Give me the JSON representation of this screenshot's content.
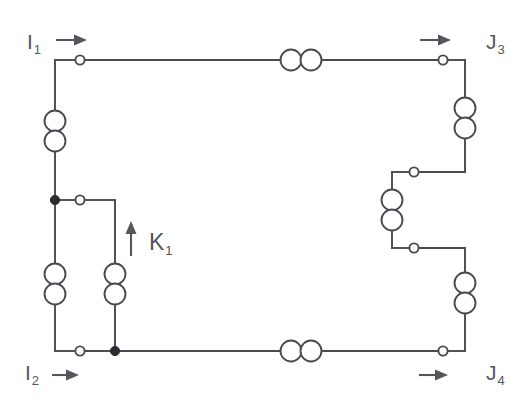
{
  "diagram": {
    "type": "electrical-circuit-schematic",
    "background_color": "#ffffff",
    "wire_color": "#4a4a52",
    "label_color": "#55555d",
    "junction_color": "#2b2b30"
  },
  "labels": {
    "input_top": {
      "symbol": "I",
      "subscript": "1",
      "text": "I1"
    },
    "input_bottom": {
      "symbol": "I",
      "subscript": "2",
      "text": "I2"
    },
    "output_top": {
      "symbol": "J",
      "subscript": "3",
      "text": "J3"
    },
    "output_bottom": {
      "symbol": "J",
      "subscript": "4",
      "text": "J4"
    },
    "branch_current": {
      "symbol": "K",
      "subscript": "1",
      "text": "K1"
    }
  },
  "arrows": [
    {
      "name": "current-arrow-i1",
      "direction": "right",
      "associated_label": "I1"
    },
    {
      "name": "current-arrow-i2",
      "direction": "right",
      "associated_label": "I2"
    },
    {
      "name": "current-arrow-j3",
      "direction": "right",
      "associated_label": "J3"
    },
    {
      "name": "current-arrow-j4",
      "direction": "right",
      "associated_label": "J4"
    },
    {
      "name": "current-arrow-k1",
      "direction": "up",
      "associated_label": "K1"
    }
  ],
  "components": {
    "coils": [
      {
        "name": "coil-top-rail",
        "orientation": "horizontal",
        "position": "top-rail-center"
      },
      {
        "name": "coil-bottom-rail",
        "orientation": "horizontal",
        "position": "bottom-rail-center"
      },
      {
        "name": "coil-left-upper",
        "orientation": "vertical",
        "position": "left-rail-upper"
      },
      {
        "name": "coil-left-lower",
        "orientation": "vertical",
        "position": "left-rail-lower"
      },
      {
        "name": "coil-middle-branch",
        "orientation": "vertical",
        "position": "middle-branch"
      },
      {
        "name": "coil-right-upper",
        "orientation": "vertical",
        "position": "right-rail-upper"
      },
      {
        "name": "coil-right-middle",
        "orientation": "vertical",
        "position": "right-staircase-middle"
      },
      {
        "name": "coil-right-lower",
        "orientation": "vertical",
        "position": "right-rail-lower"
      }
    ],
    "open_terminals": [
      {
        "name": "terminal-i1",
        "position": "top-left"
      },
      {
        "name": "terminal-j3",
        "position": "top-right"
      },
      {
        "name": "terminal-i2",
        "position": "bottom-left"
      },
      {
        "name": "terminal-j4",
        "position": "bottom-right"
      },
      {
        "name": "terminal-k1-branch",
        "position": "middle-left-branch"
      },
      {
        "name": "terminal-right-upper-step",
        "position": "right-staircase-upper"
      },
      {
        "name": "terminal-right-lower-step",
        "position": "right-staircase-lower"
      }
    ],
    "junction_dots": [
      {
        "name": "junction-left-middle",
        "position": "left-rail-middle"
      },
      {
        "name": "junction-bottom-branch",
        "position": "bottom-rail-branch"
      }
    ]
  }
}
